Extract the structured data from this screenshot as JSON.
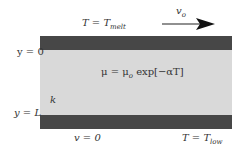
{
  "diagram": {
    "top_plate": {
      "temperature_label": "T = T",
      "temperature_subscript": "melt",
      "velocity_label": "v",
      "velocity_subscript": "o"
    },
    "bottom_plate": {
      "velocity_label": "v = 0",
      "temperature_label": "T = T",
      "temperature_subscript": "low"
    },
    "y_axis": {
      "top": "y = 0",
      "bottom": "y = L"
    },
    "fluid": {
      "viscosity_eq": "μ = μ",
      "viscosity_sub": "o",
      "viscosity_rest": " exp[−αT]",
      "conductivity_label": "k"
    },
    "colors": {
      "plate": "#474747",
      "fluid": "#d9d9d9"
    }
  }
}
